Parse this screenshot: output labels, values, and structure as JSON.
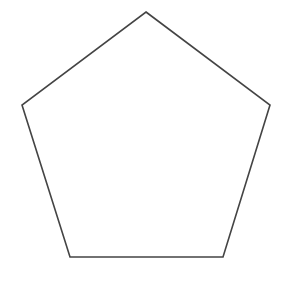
{
  "diagram": {
    "type": "polygon",
    "shape": "regular-pentagon",
    "background_color": "#ffffff",
    "stroke_color": "#444444",
    "fill_color": "none",
    "stroke_width": 1.6,
    "vertices": [
      {
        "name": "top",
        "x": 146,
        "y": 12
      },
      {
        "name": "right",
        "x": 270,
        "y": 105
      },
      {
        "name": "bottom-right",
        "x": 223,
        "y": 257
      },
      {
        "name": "bottom-left",
        "x": 70,
        "y": 257
      },
      {
        "name": "left",
        "x": 22,
        "y": 105
      }
    ]
  }
}
